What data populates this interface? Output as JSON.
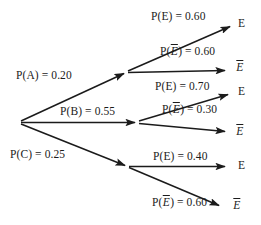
{
  "diagram": {
    "type": "probability-tree",
    "root": {
      "x": 20,
      "y": 122
    },
    "first_stage": [
      {
        "id": "A",
        "label": "P(A) = 0.20",
        "probability": 0.2,
        "event": "A",
        "node": {
          "x": 127,
          "y": 72
        },
        "label_pos": {
          "x": 16,
          "y": 69
        }
      },
      {
        "id": "B",
        "label": "P(B) = 0.55",
        "probability": 0.55,
        "event": "B",
        "node": {
          "x": 138,
          "y": 122
        },
        "label_pos": {
          "x": 60,
          "y": 105
        }
      },
      {
        "id": "C",
        "label": "P(C) = 0.25",
        "probability": 0.25,
        "event": "C",
        "node": {
          "x": 128,
          "y": 167
        },
        "label_pos": {
          "x": 10,
          "y": 148
        }
      }
    ],
    "second_stage": [
      {
        "parent": "A",
        "label_prefix": "P(",
        "label_event": "E",
        "label_suffix": ") = 0.60",
        "overline": false,
        "probability": 0.6,
        "terminal": "E",
        "node": {
          "x": 233,
          "y": 25
        },
        "label_pos": {
          "x": 151,
          "y": 10
        },
        "terminal_pos": {
          "x": 238,
          "y": 17
        }
      },
      {
        "parent": "A",
        "label_prefix": "P(",
        "label_event": "E",
        "label_suffix": ") = 0.60",
        "overline": true,
        "probability": 0.6,
        "terminal": "E",
        "node": {
          "x": 228,
          "y": 70
        },
        "label_pos": {
          "x": 160,
          "y": 45
        },
        "terminal_pos": {
          "x": 236,
          "y": 61
        }
      },
      {
        "parent": "B",
        "label_prefix": "P(",
        "label_event": "E",
        "label_suffix": ") = 0.70",
        "overline": false,
        "probability": 0.7,
        "terminal": "E",
        "node": {
          "x": 231,
          "y": 93
        },
        "label_pos": {
          "x": 155,
          "y": 80
        },
        "terminal_pos": {
          "x": 238,
          "y": 85
        }
      },
      {
        "parent": "B",
        "label_prefix": "P(",
        "label_event": "E",
        "label_suffix": ") = 0.30",
        "overline": true,
        "probability": 0.3,
        "terminal": "E",
        "node": {
          "x": 228,
          "y": 133
        },
        "label_pos": {
          "x": 162,
          "y": 103
        },
        "terminal_pos": {
          "x": 236,
          "y": 125
        }
      },
      {
        "parent": "C",
        "label_prefix": "P(",
        "label_event": "E",
        "label_suffix": ") = 0.40",
        "overline": false,
        "probability": 0.4,
        "terminal": "E",
        "node": {
          "x": 228,
          "y": 167
        },
        "label_pos": {
          "x": 153,
          "y": 150
        },
        "terminal_pos": {
          "x": 238,
          "y": 159
        }
      },
      {
        "parent": "C",
        "label_prefix": "P(",
        "label_event": "E",
        "label_suffix": ") = 0.60",
        "overline": true,
        "probability": 0.6,
        "terminal": "E",
        "node": {
          "x": 222,
          "y": 207
        },
        "label_pos": {
          "x": 152,
          "y": 196
        },
        "terminal_pos": {
          "x": 233,
          "y": 199
        }
      }
    ],
    "colors": {
      "line": "#1b1b1b",
      "text": "#1b1b1b",
      "background": "#ffffff"
    }
  },
  "labels": {
    "branch_a": "P(A) = 0.20",
    "branch_b": "P(B) = 0.55",
    "branch_c": "P(C) = 0.25",
    "a_e": "P(E) = 0.60",
    "a_ebar_prefix": "P(",
    "a_ebar_suffix": ") = 0.60",
    "b_e": "P(E) = 0.70",
    "b_ebar_suffix": ") = 0.30",
    "c_e": "P(E) = 0.40",
    "c_ebar_suffix": ") = 0.60",
    "terminal_e": "E",
    "terminal_ebar": "E",
    "ebar_open": "P(",
    "e_char": "E"
  }
}
